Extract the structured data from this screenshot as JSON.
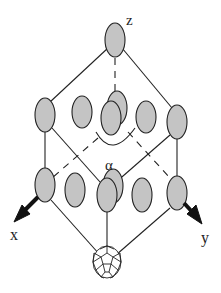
{
  "diagram": {
    "type": "crystal-lattice-schematic",
    "labels": {
      "z_axis": "z",
      "x_axis": "x",
      "y_axis": "y",
      "angle": "α"
    },
    "colors": {
      "molecule_fill": "#c4c4c4",
      "stroke": "#222222",
      "background": "#ffffff"
    },
    "nodes": {
      "top": {
        "cx": 115,
        "cy": 40
      },
      "middle_row": [
        {
          "cx": 45,
          "cy": 115
        },
        {
          "cx": 82,
          "cy": 112
        },
        {
          "cx": 117,
          "cy": 108,
          "layer": "back"
        },
        {
          "cx": 111,
          "cy": 118,
          "layer": "front"
        },
        {
          "cx": 146,
          "cy": 117
        },
        {
          "cx": 177,
          "cy": 122
        }
      ],
      "bottom_row": [
        {
          "cx": 45,
          "cy": 185
        },
        {
          "cx": 75,
          "cy": 190
        },
        {
          "cx": 113,
          "cy": 186,
          "layer": "back"
        },
        {
          "cx": 107,
          "cy": 195,
          "layer": "front"
        },
        {
          "cx": 142,
          "cy": 195
        },
        {
          "cx": 177,
          "cy": 193
        }
      ],
      "fullerene": {
        "cx": 107,
        "cy": 262
      }
    }
  }
}
